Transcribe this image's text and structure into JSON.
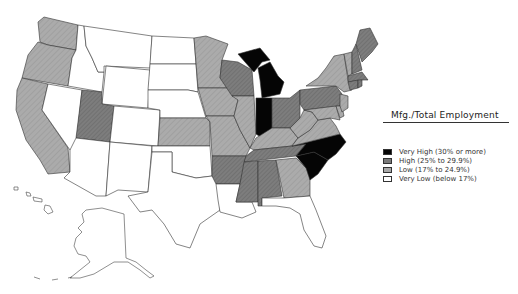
{
  "legend": {
    "title": "Mfg./Total Employment",
    "items": [
      {
        "label": "Very High (30% or more)",
        "color": "#050505"
      },
      {
        "label": "High (25% to 29.9%)",
        "color": "#7a7a7a"
      },
      {
        "label": "Low (17% to 24.9%)",
        "color": "#a9a9a9"
      },
      {
        "label": "Very Low (below 17%)",
        "color": "#ffffff"
      }
    ]
  },
  "map": {
    "subject": "United States by state: manufacturing share of total employment",
    "categories": {
      "very_high": [
        "Michigan",
        "Indiana",
        "North Carolina"
      ],
      "high": [
        "Wisconsin",
        "Ohio",
        "Pennsylvania",
        "Arkansas",
        "Mississippi",
        "Alabama",
        "Tennessee",
        "New Hampshire",
        "Maine",
        "Massachusetts",
        "Connecticut",
        "Rhode Island",
        "South Carolina"
      ],
      "low": [
        "Washington",
        "Oregon",
        "California",
        "Utah",
        "Kansas",
        "Minnesota",
        "Iowa",
        "Missouri",
        "Illinois",
        "Kentucky",
        "West Virginia",
        "Virginia",
        "Georgia",
        "New York",
        "Vermont",
        "New Jersey",
        "Delaware",
        "Maryland"
      ],
      "very_low": [
        "Idaho",
        "Montana",
        "Wyoming",
        "Nevada",
        "Arizona",
        "Colorado",
        "New Mexico",
        "North Dakota",
        "South Dakota",
        "Nebraska",
        "Oklahoma",
        "Texas",
        "Louisiana",
        "Florida",
        "Alaska",
        "Hawaii"
      ]
    }
  }
}
